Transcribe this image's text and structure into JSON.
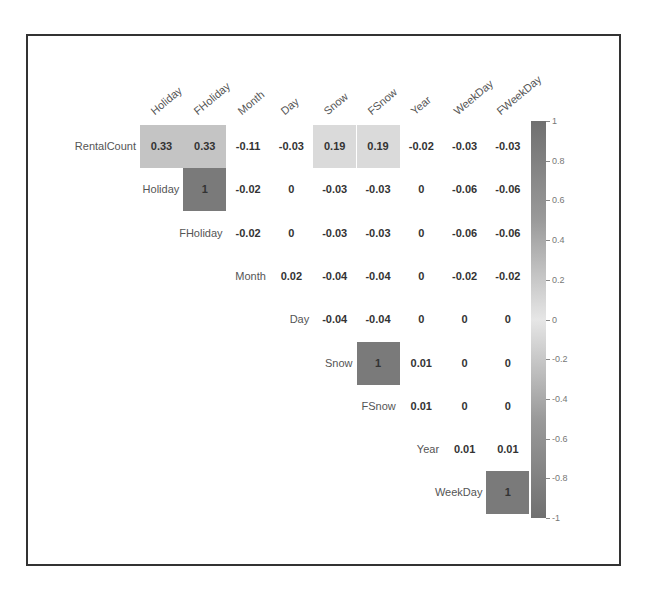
{
  "chart_data": {
    "type": "heatmap",
    "title": "",
    "subtitle": "correlation matrix (upper triangle)",
    "columns": [
      "Holiday",
      "FHoliday",
      "Month",
      "Day",
      "Snow",
      "FSnow",
      "Year",
      "WeekDay",
      "FWeekDay"
    ],
    "rows": [
      "RentalCount",
      "Holiday",
      "FHoliday",
      "Month",
      "Day",
      "Snow",
      "FSnow",
      "Year",
      "WeekDay"
    ],
    "values": [
      [
        0.33,
        0.33,
        -0.11,
        -0.03,
        0.19,
        0.19,
        -0.02,
        -0.03,
        -0.03
      ],
      [
        null,
        1,
        -0.02,
        0,
        -0.03,
        -0.03,
        0,
        -0.06,
        -0.06
      ],
      [
        null,
        null,
        -0.02,
        0,
        -0.03,
        -0.03,
        0,
        -0.06,
        -0.06
      ],
      [
        null,
        null,
        null,
        0.02,
        -0.04,
        -0.04,
        0,
        -0.02,
        -0.02
      ],
      [
        null,
        null,
        null,
        null,
        -0.04,
        -0.04,
        0,
        0,
        0
      ],
      [
        null,
        null,
        null,
        null,
        null,
        1,
        0.01,
        0,
        0
      ],
      [
        null,
        null,
        null,
        null,
        null,
        null,
        0.01,
        0,
        0
      ],
      [
        null,
        null,
        null,
        null,
        null,
        null,
        null,
        0.01,
        0.01
      ],
      [
        null,
        null,
        null,
        null,
        null,
        null,
        null,
        null,
        1
      ]
    ],
    "labels": [
      [
        "0.33",
        "0.33",
        "-0.11",
        "-0.03",
        "0.19",
        "0.19",
        "-0.02",
        "-0.03",
        "-0.03"
      ],
      [
        "",
        "1",
        "-0.02",
        "0",
        "-0.03",
        "-0.03",
        "0",
        "-0.06",
        "-0.06"
      ],
      [
        "",
        "",
        "-0.02",
        "0",
        "-0.03",
        "-0.03",
        "0",
        "-0.06",
        "-0.06"
      ],
      [
        "",
        "",
        "",
        "0.02",
        "-0.04",
        "-0.04",
        "0",
        "-0.02",
        "-0.02"
      ],
      [
        "",
        "",
        "",
        "",
        "-0.04",
        "-0.04",
        "0",
        "0",
        "0"
      ],
      [
        "",
        "",
        "",
        "",
        "",
        "1",
        "0.01",
        "0",
        "0"
      ],
      [
        "",
        "",
        "",
        "",
        "",
        "",
        "0.01",
        "0",
        "0"
      ],
      [
        "",
        "",
        "",
        "",
        "",
        "",
        "",
        "0.01",
        "0.01"
      ],
      [
        "",
        "",
        "",
        "",
        "",
        "",
        "",
        "",
        "1"
      ]
    ],
    "shaded_cells": [
      {
        "row": 0,
        "col": 0,
        "color": "#c4c4c4"
      },
      {
        "row": 0,
        "col": 1,
        "color": "#c4c4c4"
      },
      {
        "row": 0,
        "col": 4,
        "color": "#dadada"
      },
      {
        "row": 0,
        "col": 5,
        "color": "#dadada"
      },
      {
        "row": 1,
        "col": 1,
        "color": "#7a7a7a"
      },
      {
        "row": 5,
        "col": 5,
        "color": "#7a7a7a"
      },
      {
        "row": 8,
        "col": 8,
        "color": "#7a7a7a"
      }
    ],
    "colorbar": {
      "range": [
        -1,
        1
      ],
      "ticks": [
        "1",
        "0.8",
        "0.6",
        "0.4",
        "0.2",
        "0",
        "-0.2",
        "-0.4",
        "-0.6",
        "-0.8",
        "-1"
      ],
      "colors": {
        "pos_end": "#707070",
        "mid": "#e6e6e6",
        "neg_end": "#707070"
      }
    },
    "xlabel": "",
    "ylabel": "",
    "grid": false,
    "legend_position": "right"
  }
}
